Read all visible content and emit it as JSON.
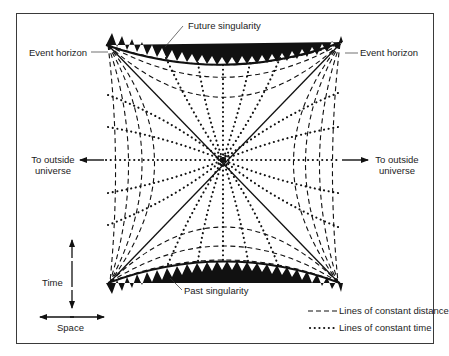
{
  "labels": {
    "future_singularity": "Future singularity",
    "past_singularity": "Past singularity",
    "event_horizon_left": "Event horizon",
    "event_horizon_right": "Event horizon",
    "outside_left_line1": "To outside",
    "outside_left_line2": "universe",
    "outside_right_line1": "To outside",
    "outside_right_line2": "universe",
    "time_axis": "Time",
    "space_axis": "Space"
  },
  "legend": {
    "items": [
      {
        "style": "dashed",
        "label": "Lines of constant distance"
      },
      {
        "style": "dotted",
        "label": "Lines of constant time"
      }
    ]
  },
  "colors": {
    "ink": "#111111",
    "frame": "#3a3a3a",
    "background": "#ffffff"
  }
}
